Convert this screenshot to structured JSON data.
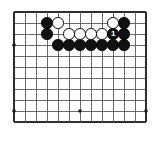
{
  "figure": {
    "kind": "go-board-diagram",
    "title": "",
    "caption": ""
  },
  "board": {
    "columns": 13,
    "rows": 11,
    "cell_size": 11,
    "origin_x": 14,
    "origin_y": 12,
    "line_color": "#5a5a5a",
    "edge_line_color": "#2e2e2e",
    "background_color": "#ffffff",
    "line_width": 0.9,
    "edge_line_width": 1.4,
    "star_point_radius": 1.8,
    "star_point_color": "#1a1a1a",
    "star_points": [
      {
        "col": 0,
        "row": 3
      },
      {
        "col": 0,
        "row": 9
      },
      {
        "col": 6,
        "row": 9
      },
      {
        "col": 12,
        "row": 9
      }
    ]
  },
  "stones": [
    {
      "col": 3,
      "row": 1,
      "color": "black",
      "label": ""
    },
    {
      "col": 4,
      "row": 1,
      "color": "white",
      "label": ""
    },
    {
      "col": 9,
      "row": 1,
      "color": "white",
      "label": ""
    },
    {
      "col": 10,
      "row": 1,
      "color": "black",
      "label": ""
    },
    {
      "col": 3,
      "row": 2,
      "color": "black",
      "label": ""
    },
    {
      "col": 5,
      "row": 2,
      "color": "white",
      "label": ""
    },
    {
      "col": 6,
      "row": 2,
      "color": "white",
      "label": ""
    },
    {
      "col": 7,
      "row": 2,
      "color": "white",
      "label": ""
    },
    {
      "col": 8,
      "row": 2,
      "color": "white",
      "label": ""
    },
    {
      "col": 9,
      "row": 2,
      "color": "black",
      "label": "1"
    },
    {
      "col": 10,
      "row": 2,
      "color": "black",
      "label": ""
    },
    {
      "col": 4,
      "row": 3,
      "color": "black",
      "label": ""
    },
    {
      "col": 5,
      "row": 3,
      "color": "black",
      "label": ""
    },
    {
      "col": 6,
      "row": 3,
      "color": "black",
      "label": ""
    },
    {
      "col": 7,
      "row": 3,
      "color": "black",
      "label": ""
    },
    {
      "col": 8,
      "row": 3,
      "color": "black",
      "label": ""
    },
    {
      "col": 9,
      "row": 3,
      "color": "black",
      "label": ""
    },
    {
      "col": 10,
      "row": 3,
      "color": "black",
      "label": ""
    }
  ],
  "stone_style": {
    "diameter": 11.6,
    "black_fill": "#111111",
    "white_fill": "#ffffff",
    "white_outline": "#0a0a0a",
    "label_on_black_color": "#ffffff",
    "label_on_white_color": "#000000"
  }
}
